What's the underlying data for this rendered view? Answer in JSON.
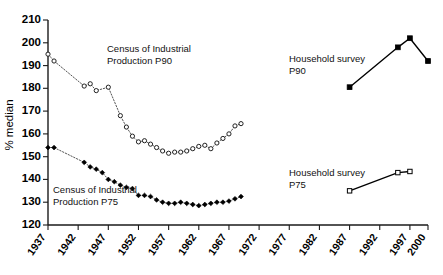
{
  "chart_data": {
    "type": "scatter",
    "title": "",
    "xlabel": "",
    "ylabel": "% median",
    "xlim": [
      1937,
      2000
    ],
    "ylim": [
      120,
      210
    ],
    "grid": false,
    "legend": "annotations-inline",
    "xticks": [
      "1937",
      "1942",
      "1947",
      "1952",
      "1957",
      "1962",
      "1967",
      "1972",
      "1977",
      "1982",
      "1987",
      "1992",
      "1997",
      "2000"
    ],
    "yticks": [
      "120",
      "130",
      "140",
      "150",
      "160",
      "170",
      "180",
      "190",
      "200",
      "210"
    ],
    "series": [
      {
        "name": "Census of Industrial Production P90",
        "marker": "open-circle",
        "line": "dotted",
        "x": [
          1937,
          1938,
          1943,
          1944,
          1945,
          1947,
          1949,
          1950,
          1951,
          1952,
          1953,
          1954,
          1955,
          1956,
          1957,
          1958,
          1959,
          1960,
          1961,
          1962,
          1963,
          1964,
          1965,
          1966,
          1967,
          1968,
          1969
        ],
        "y": [
          195,
          192,
          181,
          182,
          179,
          180.5,
          168,
          163,
          159,
          156.5,
          157,
          155.5,
          154,
          152.5,
          151.5,
          152,
          152,
          152.5,
          153.5,
          154.5,
          155,
          153.5,
          156,
          158,
          160,
          163.5,
          164.5
        ]
      },
      {
        "name": "Census of Industrial Production P75",
        "marker": "filled-diamond",
        "line": "dotted",
        "x": [
          1937,
          1938,
          1943,
          1944,
          1945,
          1946,
          1947,
          1948,
          1949,
          1950,
          1951,
          1952,
          1953,
          1954,
          1955,
          1956,
          1957,
          1958,
          1959,
          1960,
          1961,
          1962,
          1963,
          1964,
          1965,
          1966,
          1967,
          1968,
          1969
        ],
        "y": [
          154,
          154,
          147.5,
          145.5,
          144.5,
          143,
          140,
          139,
          137.5,
          136.5,
          136,
          133,
          133,
          132.5,
          131,
          130,
          129.5,
          129.5,
          130,
          129.5,
          129,
          128.5,
          129,
          129.5,
          130,
          130,
          130.5,
          131.5,
          132.5
        ]
      },
      {
        "name": "Household survey P90",
        "marker": "filled-square",
        "line": "solid",
        "x": [
          1987,
          1995,
          1997,
          2000
        ],
        "y": [
          180.5,
          198,
          202,
          192
        ]
      },
      {
        "name": "Household survey P75",
        "marker": "open-square",
        "line": "solid",
        "x": [
          1987,
          1995,
          1997
        ],
        "y": [
          135,
          143,
          143.5
        ]
      }
    ],
    "annotations": [
      {
        "id": "annot-cip-p90",
        "lines": [
          "Census of Industrial",
          "Production P90"
        ],
        "x": 1950,
        "y": 190
      },
      {
        "id": "annot-cip-p75",
        "lines": [
          "Census of Industrial",
          "Production P75"
        ],
        "x": 1938,
        "y": 137
      },
      {
        "id": "annot-hs-p90",
        "lines": [
          "Household survey",
          "P90"
        ],
        "x": 1977,
        "y": 184
      },
      {
        "id": "annot-hs-p75",
        "lines": [
          "Household survey",
          "P75"
        ],
        "x": 1977,
        "y": 146
      }
    ]
  },
  "axes": {
    "y_axis_title": "% median",
    "y_tick_labels": [
      "210",
      "200",
      "190",
      "180",
      "170",
      "160",
      "150",
      "140",
      "130",
      "120"
    ],
    "x_tick_labels": [
      "1937",
      "1942",
      "1947",
      "1952",
      "1957",
      "1962",
      "1967",
      "1972",
      "1977",
      "1982",
      "1987",
      "1992",
      "1997",
      "2000"
    ]
  },
  "annotations": {
    "cip_p90_line1": "Census of Industrial",
    "cip_p90_line2": "Production P90",
    "cip_p75_line1": "Census of Industrial",
    "cip_p75_line2": "Production P75",
    "hs_p90_line1": "Household survey",
    "hs_p90_line2": "P90",
    "hs_p75_line1": "Household survey",
    "hs_p75_line2": "P75"
  },
  "colors": {
    "axis": "#1a1a1a",
    "dotted_series": "#555555",
    "solid_series": "#000000",
    "background": "#ffffff"
  }
}
